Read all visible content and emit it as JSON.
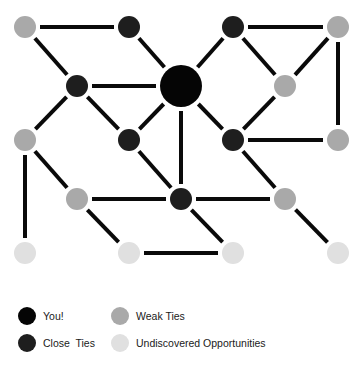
{
  "colors": {
    "you": "#050505",
    "close": "#1e1e1e",
    "weak": "#a9a9a9",
    "undiscovered": "#e0e0e0",
    "edge": "#0a0a0a",
    "background": "#ffffff"
  },
  "nodes": [
    {
      "id": "n1",
      "type": "weak",
      "x": 25,
      "y": 27
    },
    {
      "id": "n2",
      "type": "close",
      "x": 129,
      "y": 27
    },
    {
      "id": "n3",
      "type": "close",
      "x": 233,
      "y": 27
    },
    {
      "id": "n4",
      "type": "weak",
      "x": 338,
      "y": 27
    },
    {
      "id": "n5",
      "type": "close",
      "x": 77,
      "y": 86
    },
    {
      "id": "you",
      "type": "you",
      "x": 181,
      "y": 86
    },
    {
      "id": "n6",
      "type": "weak",
      "x": 285,
      "y": 86
    },
    {
      "id": "n7",
      "type": "weak",
      "x": 25,
      "y": 140
    },
    {
      "id": "n8",
      "type": "close",
      "x": 129,
      "y": 140
    },
    {
      "id": "n9",
      "type": "close",
      "x": 233,
      "y": 140
    },
    {
      "id": "n10",
      "type": "weak",
      "x": 338,
      "y": 140
    },
    {
      "id": "n11",
      "type": "weak",
      "x": 77,
      "y": 199
    },
    {
      "id": "n12",
      "type": "close",
      "x": 181,
      "y": 199
    },
    {
      "id": "n13",
      "type": "weak",
      "x": 285,
      "y": 199
    },
    {
      "id": "n14",
      "type": "undiscovered",
      "x": 25,
      "y": 253
    },
    {
      "id": "n15",
      "type": "undiscovered",
      "x": 129,
      "y": 253
    },
    {
      "id": "n16",
      "type": "undiscovered",
      "x": 233,
      "y": 253
    },
    {
      "id": "n17",
      "type": "undiscovered",
      "x": 338,
      "y": 253
    }
  ],
  "edges": [
    [
      "n1",
      "n2"
    ],
    [
      "n1",
      "n5"
    ],
    [
      "n2",
      "you"
    ],
    [
      "n3",
      "you"
    ],
    [
      "n3",
      "n4"
    ],
    [
      "n3",
      "n6"
    ],
    [
      "n4",
      "n6"
    ],
    [
      "n4",
      "n10"
    ],
    [
      "n5",
      "you"
    ],
    [
      "n5",
      "n7"
    ],
    [
      "n5",
      "n8"
    ],
    [
      "you",
      "n8"
    ],
    [
      "you",
      "n9"
    ],
    [
      "you",
      "n12"
    ],
    [
      "n6",
      "n9"
    ],
    [
      "n9",
      "n10"
    ],
    [
      "n9",
      "n13"
    ],
    [
      "n7",
      "n14"
    ],
    [
      "n7",
      "n11"
    ],
    [
      "n8",
      "n12"
    ],
    [
      "n11",
      "n12"
    ],
    [
      "n12",
      "n13"
    ],
    [
      "n11",
      "n15"
    ],
    [
      "n12",
      "n16"
    ],
    [
      "n15",
      "n16"
    ],
    [
      "n13",
      "n17"
    ]
  ],
  "node_radius": {
    "you": 21,
    "close": 11,
    "weak": 11,
    "undiscovered": 11
  },
  "legend": {
    "items": [
      {
        "label": "You!",
        "type": "you"
      },
      {
        "label": "Close  Ties",
        "type": "close"
      },
      {
        "label": "Weak Ties",
        "type": "weak"
      },
      {
        "label": "Undiscovered Opportunities",
        "type": "undiscovered"
      }
    ]
  }
}
